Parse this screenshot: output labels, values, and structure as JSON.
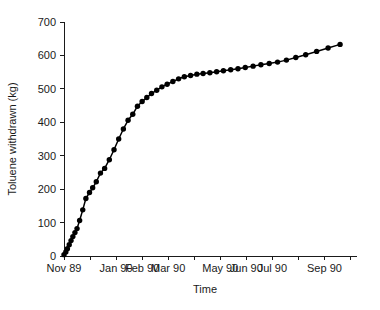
{
  "chart_data": {
    "type": "line",
    "title": "",
    "subtitle": "",
    "xlabel": "Time",
    "ylabel": "Toluene withdrawn (kg)",
    "ylim": [
      0,
      700
    ],
    "yticks": [
      0,
      100,
      200,
      300,
      400,
      500,
      600,
      700
    ],
    "ytick_labels": [
      "0",
      "100",
      "200",
      "300",
      "400",
      "500",
      "600",
      "700"
    ],
    "grid": false,
    "legend": null,
    "legend_position": "none",
    "xtick_labels": [
      "Nov 89",
      "",
      "Jan 90",
      "Feb 90",
      "Mar 90",
      "",
      "May 90",
      "Jun 90",
      "Jul 90",
      "",
      "Sep 90",
      ""
    ],
    "xtick_count": 12,
    "marker": "filled-circle",
    "marker_color": "#000000",
    "line_color": "#000000",
    "series": [
      {
        "name": "Toluene withdrawn",
        "x": [
          0.0,
          0.07,
          0.13,
          0.2,
          0.27,
          0.34,
          0.42,
          0.5,
          0.6,
          0.72,
          0.84,
          0.98,
          1.1,
          1.24,
          1.4,
          1.56,
          1.74,
          1.92,
          2.1,
          2.28,
          2.46,
          2.64,
          2.82,
          3.0,
          3.18,
          3.36,
          3.56,
          3.76,
          3.96,
          4.18,
          4.4,
          4.62,
          4.86,
          5.1,
          5.34,
          5.6,
          5.86,
          6.12,
          6.4,
          6.68,
          6.96,
          7.26,
          7.56,
          7.88,
          8.2,
          8.54,
          8.9,
          9.28,
          9.7,
          10.14,
          10.6
        ],
        "y": [
          4,
          12,
          22,
          34,
          46,
          58,
          70,
          82,
          106,
          138,
          172,
          190,
          204,
          222,
          248,
          262,
          288,
          318,
          350,
          380,
          406,
          424,
          448,
          462,
          474,
          486,
          496,
          506,
          514,
          522,
          530,
          536,
          540,
          544,
          546,
          548,
          551,
          554,
          557,
          560,
          564,
          568,
          572,
          576,
          580,
          586,
          594,
          602,
          612,
          622,
          633
        ]
      }
    ]
  },
  "axes": {
    "y_axis_name": "Toluene withdrawn (kg)",
    "x_axis_name": "Time"
  }
}
